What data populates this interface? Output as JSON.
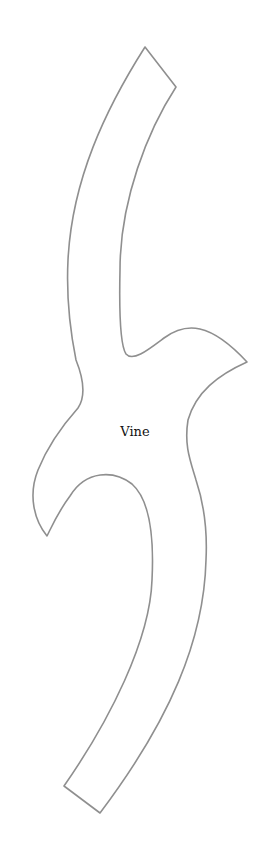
{
  "diagram": {
    "shape": {
      "name": "vine",
      "label": "Vine",
      "stroke": "#8f8f8f",
      "fill": "#ffffff"
    }
  }
}
